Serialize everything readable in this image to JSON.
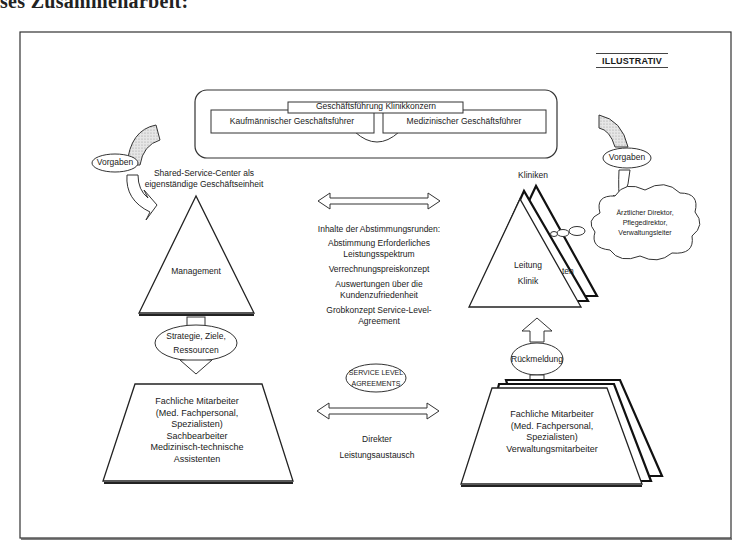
{
  "page": {
    "cut_heading": "ses Zusammenarbeit:",
    "label_illustrative": "ILLUSTRATIV"
  },
  "top": {
    "concern_management": "Geschäftsführung Klinikkonzern",
    "commercial_director": "Kaufmännischer Geschäftsführer",
    "medical_director": "Medizinischer Geschäftsführer"
  },
  "left": {
    "vorgaben": "Vorgaben",
    "ssc_title_line1": "Shared-Service-Center als",
    "ssc_title_line2": "eigenständige Geschäftseinheit",
    "management": "Management",
    "strategy_line1": "Strategie, Ziele,",
    "strategy_line2": "Ressourcen",
    "staff_lines": [
      "Fachliche Mitarbeiter",
      "(Med. Fachpersonal,",
      "Spezialisten)",
      "Sachbearbeiter",
      "Medizinisch-technische",
      "Assistenten"
    ]
  },
  "center": {
    "topics_heading": "Inhalte der Abstimmungsrunden:",
    "topics": [
      "Abstimmung Erforderliches",
      "Leistungsspektrum",
      "Verrechnungspreiskonzept",
      "Auswertungen über die",
      "Kundenzufriedenheit",
      "Grobkonzept Service-Level-",
      "Agreement"
    ],
    "sla_line1": "SERVICE LEVEL",
    "sla_line2": "AGREEMENTS",
    "exchange_line1": "Direkter",
    "exchange_line2": "Leistungsaustausch"
  },
  "right": {
    "vorgaben": "Vorgaben",
    "clinics": "Kliniken",
    "cloud_lines": [
      "Ärztlicher Direktor,",
      "Pflegedirektor,",
      "Verwaltungsleiter"
    ],
    "leitung": "Leitung",
    "klinik": "Klinik",
    "behind_fragment": "ten",
    "feedback": "Rückmeldung",
    "staff_lines": [
      "Fachliche Mitarbeiter",
      "(Med. Fachpersonal,",
      "Spezialisten)",
      "Verwaltungsmitarbeiter"
    ]
  }
}
